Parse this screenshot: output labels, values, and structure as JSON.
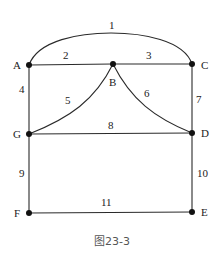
{
  "diagram": {
    "caption": "图23-3",
    "nodes": [
      {
        "id": "A",
        "x": 29,
        "y": 65,
        "label": "A",
        "lx": 13,
        "ly": 69
      },
      {
        "id": "B",
        "x": 113,
        "y": 64,
        "label": "B",
        "lx": 109,
        "ly": 86
      },
      {
        "id": "C",
        "x": 192,
        "y": 64,
        "label": "C",
        "lx": 201,
        "ly": 69
      },
      {
        "id": "G",
        "x": 29,
        "y": 134,
        "label": "G",
        "lx": 13,
        "ly": 138
      },
      {
        "id": "D",
        "x": 192,
        "y": 133,
        "label": "D",
        "lx": 201,
        "ly": 137
      },
      {
        "id": "F",
        "x": 29,
        "y": 213,
        "label": "F",
        "lx": 14,
        "ly": 217
      },
      {
        "id": "E",
        "x": 192,
        "y": 212,
        "label": "E",
        "lx": 201,
        "ly": 216
      }
    ],
    "edges": [
      {
        "id": "1",
        "from": "A",
        "to": "C",
        "label": "1",
        "shape": "arc"
      },
      {
        "id": "2",
        "from": "A",
        "to": "B",
        "label": "2",
        "shape": "line"
      },
      {
        "id": "3",
        "from": "B",
        "to": "C",
        "label": "3",
        "shape": "line"
      },
      {
        "id": "4",
        "from": "A",
        "to": "G",
        "label": "4",
        "shape": "line"
      },
      {
        "id": "5",
        "from": "B",
        "to": "G",
        "label": "5",
        "shape": "concave-curve"
      },
      {
        "id": "6",
        "from": "B",
        "to": "D",
        "label": "6",
        "shape": "concave-curve"
      },
      {
        "id": "7",
        "from": "C",
        "to": "D",
        "label": "7",
        "shape": "line"
      },
      {
        "id": "8",
        "from": "G",
        "to": "D",
        "label": "8",
        "shape": "line"
      },
      {
        "id": "9",
        "from": "G",
        "to": "F",
        "label": "9",
        "shape": "line"
      },
      {
        "id": "10",
        "from": "D",
        "to": "E",
        "label": "10",
        "shape": "line"
      },
      {
        "id": "11",
        "from": "F",
        "to": "E",
        "label": "11",
        "shape": "line"
      }
    ]
  }
}
